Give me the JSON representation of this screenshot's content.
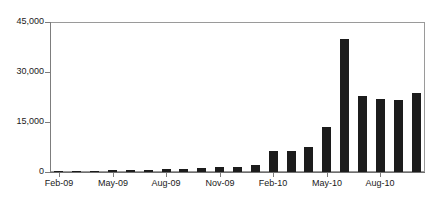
{
  "chart_data": {
    "type": "bar",
    "title": "",
    "subtitle": "",
    "xlabel": "",
    "ylabel": "",
    "ylim": [
      0,
      45000
    ],
    "yticks": [
      0,
      15000,
      30000,
      45000
    ],
    "ytick_labels": [
      "0",
      "15,000",
      "30,000",
      "45,000"
    ],
    "grid": false,
    "legend": null,
    "bar_color": "#1c1c1c",
    "frame_color": "#9a9a9a",
    "axis_color": "#7d7d7d",
    "categories": [
      "Feb-09",
      "Mar-09",
      "Apr-09",
      "May-09",
      "Jun-09",
      "Jul-09",
      "Aug-09",
      "Sep-09",
      "Oct-09",
      "Nov-09",
      "Dec-09",
      "Jan-10",
      "Feb-10",
      "Mar-10",
      "Apr-10",
      "May-10",
      "Jun-10",
      "Jul-10",
      "Aug-10",
      "Sep-10",
      "Oct-10"
    ],
    "values": [
      300,
      400,
      350,
      500,
      600,
      650,
      800,
      900,
      1200,
      1500,
      1600,
      2000,
      6300,
      6400,
      7500,
      13500,
      40000,
      22700,
      22000,
      21700,
      23800
    ],
    "xtick_labels": [
      "Feb-09",
      "May-09",
      "Aug-09",
      "Nov-09",
      "Feb-10",
      "May-10",
      "Aug-10"
    ],
    "xtick_indices": [
      0,
      3,
      6,
      9,
      12,
      15,
      18
    ]
  }
}
